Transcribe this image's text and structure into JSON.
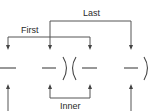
{
  "diagram": {
    "labels": {
      "first": "First",
      "last": "Last",
      "inner": "Inner"
    },
    "expression": {
      "left_group": [
        "—",
        "—"
      ],
      "separator": ")(",
      "right_group": [
        "—",
        "—"
      ],
      "closing": ")"
    },
    "brackets": [
      {
        "name": "last",
        "label": "Last",
        "from_term": 2,
        "to_term": 4,
        "position": "above",
        "arrow_direction": "down"
      },
      {
        "name": "first",
        "label": "First",
        "from_term": 1,
        "to_term": 3,
        "position": "above",
        "arrow_direction": "down"
      },
      {
        "name": "inner",
        "label": "Inner",
        "from_term": 2,
        "to_term": 3,
        "position": "below",
        "arrow_direction": "up"
      },
      {
        "name": "outer",
        "label": "",
        "from_term": 1,
        "to_term": 4,
        "position": "below",
        "arrow_direction": "up",
        "note": "cut off at bottom edge"
      }
    ],
    "colors": {
      "line": "#555555",
      "text": "#2a2a2a",
      "background": "#ffffff"
    }
  }
}
